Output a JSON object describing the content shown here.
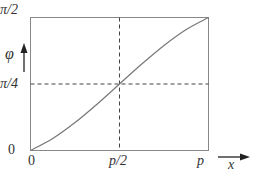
{
  "chart_data": {
    "type": "line",
    "title": "",
    "xlabel": "x",
    "ylabel": "φ",
    "x_ticks": [
      "0",
      "p/2",
      "p"
    ],
    "y_ticks": [
      "0",
      "π/4",
      "π/2"
    ],
    "xlim": [
      "0",
      "p"
    ],
    "ylim": [
      "0",
      "π/2"
    ],
    "series": [
      {
        "name": "φ(x)",
        "x": [
          0,
          0.125,
          0.25,
          0.375,
          0.5,
          0.625,
          0.75,
          0.875,
          1.0
        ],
        "y": [
          0,
          0.09,
          0.21,
          0.35,
          0.5,
          0.65,
          0.79,
          0.91,
          1.0
        ],
        "x_unit": "fraction of p",
        "y_unit": "fraction of π/2"
      }
    ],
    "reference_lines": [
      {
        "orientation": "vertical",
        "at": "p/2",
        "style": "dashed"
      },
      {
        "orientation": "horizontal",
        "at": "π/4",
        "style": "dashed"
      }
    ],
    "grid": false,
    "legend": "none"
  },
  "labels": {
    "y_top": "π/2",
    "y_mid": "π/4",
    "y_zero": "0",
    "y_axis": "φ",
    "x_zero": "0",
    "x_mid": "p/2",
    "x_end": "p",
    "x_axis": "x"
  }
}
